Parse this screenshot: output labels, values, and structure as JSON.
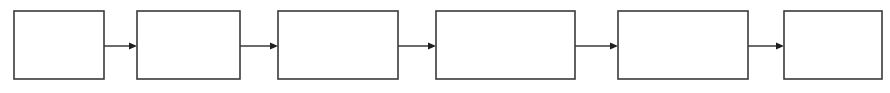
{
  "figure": {
    "type": "block-diagram",
    "title": "",
    "background_color": "#ffffff",
    "width": 890,
    "height": 93,
    "stroke_color": "#3a3a3a",
    "arrow_color": "#1f1f1f",
    "node_fill": "#ffffff"
  },
  "nodes": [
    {
      "id": "node-1",
      "label": "",
      "x": 14,
      "y": 11,
      "w": 90,
      "h": 68
    },
    {
      "id": "node-2",
      "label": "",
      "x": 137,
      "y": 11,
      "w": 103,
      "h": 68
    },
    {
      "id": "node-3",
      "label": "",
      "x": 278,
      "y": 11,
      "w": 120,
      "h": 68
    },
    {
      "id": "node-4",
      "label": "",
      "x": 436,
      "y": 11,
      "w": 139,
      "h": 68
    },
    {
      "id": "node-5",
      "label": "",
      "x": 618,
      "y": 11,
      "w": 130,
      "h": 68
    },
    {
      "id": "node-6",
      "label": "",
      "x": 784,
      "y": 11,
      "w": 98,
      "h": 68
    }
  ],
  "edges": [
    {
      "id": "edge-1-2",
      "label": "",
      "from": "node-1",
      "to": "node-2",
      "x1": 104,
      "x2": 137,
      "y": 46
    },
    {
      "id": "edge-2-3",
      "label": "",
      "from": "node-2",
      "to": "node-3",
      "x1": 240,
      "x2": 278,
      "y": 46
    },
    {
      "id": "edge-3-4",
      "label": "",
      "from": "node-3",
      "to": "node-4",
      "x1": 398,
      "x2": 436,
      "y": 46
    },
    {
      "id": "edge-4-5",
      "label": "",
      "from": "node-4",
      "to": "node-5",
      "x1": 575,
      "x2": 618,
      "y": 46
    },
    {
      "id": "edge-5-6",
      "label": "",
      "from": "node-5",
      "to": "node-6",
      "x1": 748,
      "x2": 784,
      "y": 46
    }
  ]
}
